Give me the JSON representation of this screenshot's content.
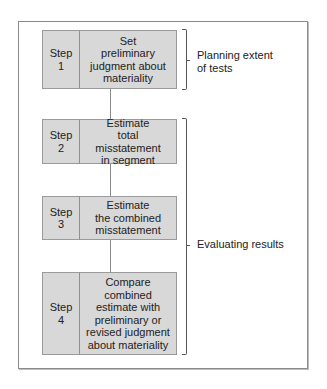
{
  "diagram": {
    "steps": [
      {
        "step_label": "Step\n1",
        "description": "Set\npreliminary\njudgment about\nmateriality"
      },
      {
        "step_label": "Step\n2",
        "description": "Estimate\ntotal misstatement\nin segment"
      },
      {
        "step_label": "Step\n3",
        "description": "Estimate\nthe combined\nmisstatement"
      },
      {
        "step_label": "Step\n4",
        "description": "Compare\ncombined\nestimate with\npreliminary or\nrevised judgment\nabout materiality"
      }
    ],
    "groups": [
      {
        "label": "Planning extent\nof tests",
        "covers_steps": [
          1
        ]
      },
      {
        "label": "Evaluating results",
        "covers_steps": [
          2,
          3,
          4
        ]
      }
    ],
    "colors": {
      "box_fill": "#d8d8d8",
      "box_border": "#9a9a9a",
      "frame_border": "#8a8a8a"
    }
  }
}
